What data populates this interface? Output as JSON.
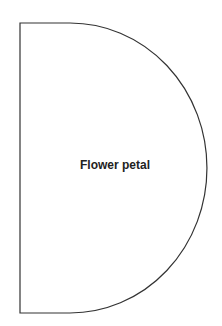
{
  "diagram": {
    "shape": "half-disc petal template",
    "label": "Flower petal",
    "stroke_color": "#333333",
    "fill_color": "#ffffff"
  }
}
